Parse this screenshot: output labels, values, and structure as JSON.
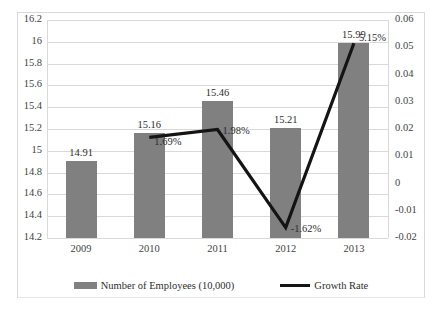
{
  "chart_data": {
    "type": "bar",
    "title": "",
    "subtitle": "",
    "xlabel": "",
    "ylabel": "",
    "categories": [
      "2009",
      "2010",
      "2011",
      "2012",
      "2013"
    ],
    "grid": true,
    "legend_position": "bottom",
    "series": [
      {
        "name": "Number of Employees (10,000)",
        "type": "bar",
        "color": "#808080",
        "axis": "left",
        "values": [
          14.91,
          15.16,
          15.46,
          15.21,
          15.99
        ],
        "data_labels": [
          "14.91",
          "15.16",
          "15.46",
          "15.21",
          "15.99"
        ]
      },
      {
        "name": "Growth Rate",
        "type": "line",
        "color": "#141414",
        "axis": "right",
        "x": [
          "2010",
          "2011",
          "2012",
          "2013"
        ],
        "values": [
          0.0169,
          0.0198,
          -0.0162,
          0.0515
        ],
        "data_labels": [
          "1.69%",
          "1.98%",
          "-1.62%",
          "5.15%"
        ]
      }
    ],
    "left_axis": {
      "ylim": [
        14.2,
        16.2
      ],
      "step": 0.2,
      "ticks": [
        "16.2",
        "16",
        "15.8",
        "15.6",
        "15.4",
        "15.2",
        "15",
        "14.8",
        "14.6",
        "14.4",
        "14.2"
      ]
    },
    "right_axis": {
      "ylim": [
        -0.02,
        0.06
      ],
      "step": 0.01,
      "ticks": [
        "0.06",
        "0.05",
        "0.04",
        "0.03",
        "0.02",
        "0.01",
        "0",
        "-0.01",
        "-0.02"
      ]
    }
  },
  "legend": {
    "entries": [
      {
        "label": "Number of Employees (10,000)",
        "marker": "bar-swatch"
      },
      {
        "label": "Growth Rate",
        "marker": "line-swatch"
      }
    ]
  },
  "colors": {
    "bar": "#808080",
    "line": "#141414",
    "grid": "#d9d9d9",
    "frame": "#d9d9d9",
    "text": "#3f3f3f",
    "background": "#ffffff"
  }
}
